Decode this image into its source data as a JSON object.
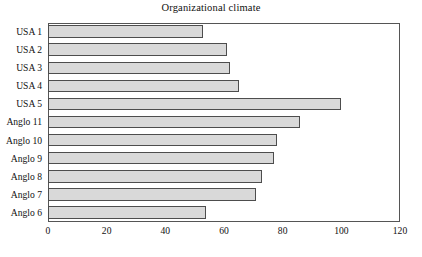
{
  "chart_data": {
    "type": "bar",
    "orientation": "horizontal",
    "title": "Organizational climate",
    "xlabel": "",
    "ylabel": "",
    "categories": [
      "USA 1",
      "USA 2",
      "USA 3",
      "USA 4",
      "USA 5",
      "Anglo 11",
      "Anglo 10",
      "Anglo 9",
      "Anglo 8",
      "Anglo 7",
      "Anglo 6"
    ],
    "values": [
      53,
      61,
      62,
      65,
      100,
      86,
      78,
      77,
      73,
      71,
      54
    ],
    "xlim": [
      0,
      120
    ],
    "xticks": [
      0,
      20,
      40,
      60,
      80,
      100,
      120
    ],
    "xtick_labels": [
      "0",
      "20",
      "40",
      "60",
      "80",
      "100",
      "120"
    ],
    "grid": false,
    "legend": false,
    "bar_fill_color": "#d9d9d9",
    "bar_edge_color": "#4d4d4d",
    "frame_color": "#555555",
    "background_color": "#ffffff"
  }
}
